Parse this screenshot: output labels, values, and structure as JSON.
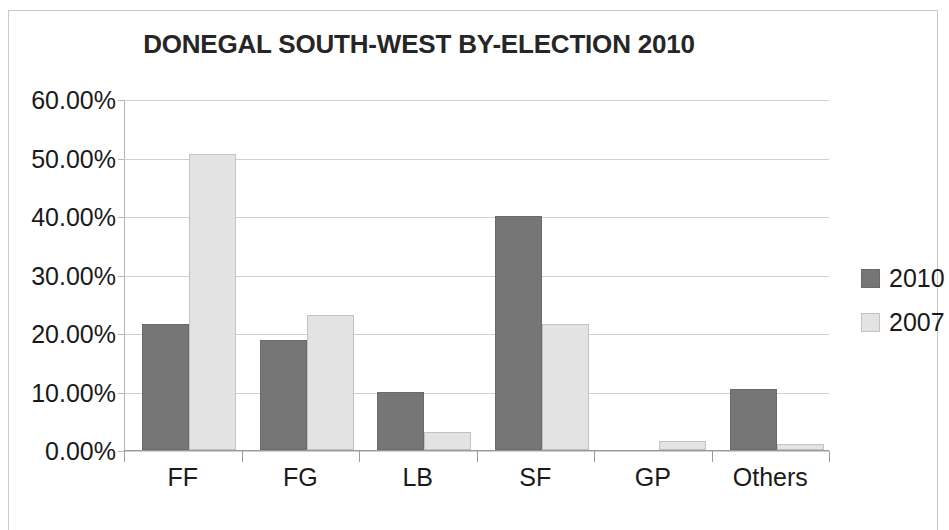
{
  "chart_data": {
    "type": "bar",
    "title": "DONEGAL SOUTH-WEST BY-ELECTION 2010",
    "xlabel": "",
    "ylabel": "",
    "categories": [
      "FF",
      "FG",
      "LB",
      "SF",
      "GP",
      "Others"
    ],
    "series": [
      {
        "name": "2010",
        "color": "#767676",
        "values": [
          21.5,
          18.8,
          9.9,
          40.0,
          0.0,
          10.5
        ]
      },
      {
        "name": "2007",
        "color": "#e3e3e3",
        "values": [
          50.6,
          23.0,
          3.0,
          21.6,
          1.5,
          1.1
        ]
      }
    ],
    "ylim": [
      0,
      60
    ],
    "ytick_values": [
      60,
      50,
      40,
      30,
      20,
      10,
      0
    ],
    "ytick_labels": [
      "60.00%",
      "50.00%",
      "40.00%",
      "30.00%",
      "20.00%",
      "10.00%",
      "0.00%"
    ],
    "grid": true,
    "legend_position": "right",
    "legend_entries": [
      "2010",
      "2007"
    ]
  },
  "frame": {
    "border_color": "#c9c9c9",
    "background": "#ffffff"
  }
}
